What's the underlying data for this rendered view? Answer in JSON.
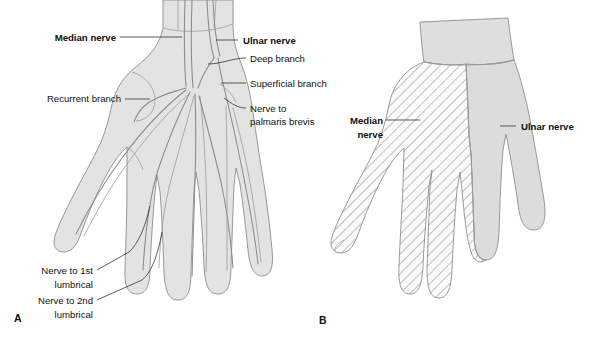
{
  "figure": {
    "background_color": "#ffffff",
    "skin_color": "#e3e3e3",
    "nerve_color": "#8a8a8a",
    "outline_color": "#8d8d8d",
    "text_color": "#111111"
  },
  "panel_a": {
    "id": "A",
    "labels": {
      "median_nerve": "Median nerve",
      "ulnar_nerve": "Ulnar nerve",
      "deep_branch": "Deep branch",
      "superficial_branch": "Superficial branch",
      "nerve_to_palmaris_line1": "Nerve to",
      "nerve_to_palmaris_line2": "palmaris brevis",
      "recurrent_branch": "Recurrent branch",
      "lumbrical_1_line1": "Nerve to 1st",
      "lumbrical_1_line2": "lumbrical",
      "lumbrical_2_line1": "Nerve to 2nd",
      "lumbrical_2_line2": "lumbrical"
    }
  },
  "panel_b": {
    "id": "B",
    "labels": {
      "median_nerve_line1": "Median",
      "median_nerve_line2": "nerve",
      "ulnar_nerve": "Ulnar nerve"
    },
    "territories": {
      "median_pattern": "diagonal-hatch",
      "ulnar_pattern": "solid-grey"
    }
  }
}
